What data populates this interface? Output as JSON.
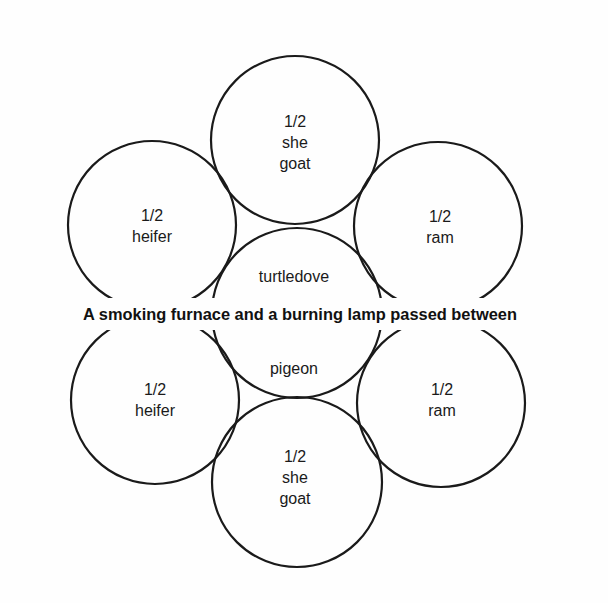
{
  "diagram": {
    "caption": "A smoking furnace and a burning lamp passed between",
    "circles": [
      {
        "id": "top",
        "cx": 295,
        "cy": 140,
        "r": 84,
        "lines": [
          "1/2",
          "she",
          "goat"
        ]
      },
      {
        "id": "upper-left",
        "cx": 152,
        "cy": 225,
        "r": 84,
        "lines": [
          "1/2",
          "heifer"
        ]
      },
      {
        "id": "upper-right",
        "cx": 438,
        "cy": 226,
        "r": 84,
        "lines": [
          "1/2",
          "ram"
        ]
      },
      {
        "id": "center",
        "cx": 297,
        "cy": 313,
        "r": 85,
        "lines": [
          "turtledove",
          "pigeon"
        ]
      },
      {
        "id": "lower-left",
        "cx": 155,
        "cy": 400,
        "r": 84,
        "lines": [
          "1/2",
          "heifer"
        ]
      },
      {
        "id": "lower-right",
        "cx": 441,
        "cy": 403,
        "r": 84,
        "lines": [
          "1/2",
          "ram"
        ]
      },
      {
        "id": "bottom",
        "cx": 297,
        "cy": 482,
        "r": 85,
        "lines": [
          "1/2",
          "she",
          "goat"
        ]
      }
    ]
  }
}
